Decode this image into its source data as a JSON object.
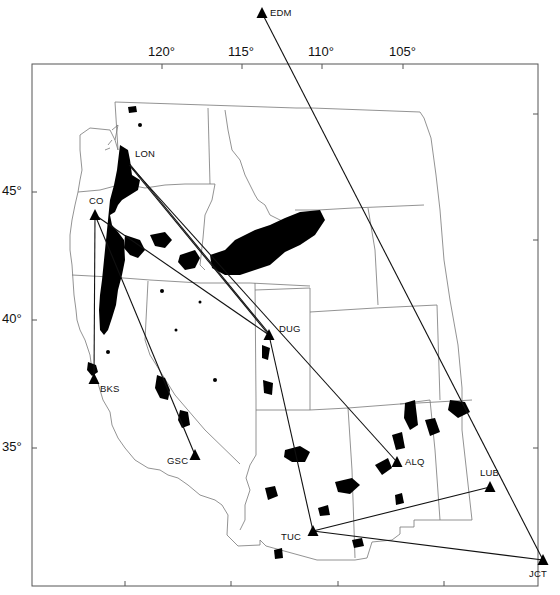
{
  "map": {
    "frame": {
      "left": 32,
      "top": 64,
      "right": 538,
      "bottom": 586
    },
    "colors": {
      "frame": "#555555",
      "border": "#777777",
      "path": "#111111",
      "lava": "#000000",
      "background": "#ffffff"
    },
    "axes": {
      "top_ticks": [
        {
          "label": "120°",
          "x": 162
        },
        {
          "label": "115°",
          "x": 242
        },
        {
          "label": "110°",
          "x": 322
        },
        {
          "label": "105°",
          "x": 403
        }
      ],
      "left_ticks": [
        {
          "label": "45°",
          "y": 192
        },
        {
          "label": "40°",
          "y": 320
        },
        {
          "label": "35°",
          "y": 448
        }
      ],
      "bottom_ticks_x": [
        125,
        231,
        338,
        444
      ],
      "right_ticks_y": [
        114,
        240,
        448
      ]
    },
    "stations": [
      {
        "code": "EDM",
        "x": 262,
        "y": 13,
        "label_dx": 8,
        "label_dy": -6
      },
      {
        "code": "LON",
        "x": 125,
        "y": 160,
        "label_dx": 10,
        "label_dy": -12
      },
      {
        "code": "CO",
        "x": 95,
        "y": 215,
        "label_dx": -6,
        "label_dy": -20
      },
      {
        "code": "BKS",
        "x": 94,
        "y": 379,
        "label_dx": 6,
        "label_dy": 4
      },
      {
        "code": "DUG",
        "x": 269,
        "y": 335,
        "label_dx": 10,
        "label_dy": -12
      },
      {
        "code": "GSC",
        "x": 195,
        "y": 455,
        "label_dx": -28,
        "label_dy": 0
      },
      {
        "code": "ALQ",
        "x": 397,
        "y": 462,
        "label_dx": 8,
        "label_dy": -6
      },
      {
        "code": "LUB",
        "x": 490,
        "y": 487,
        "label_dx": -10,
        "label_dy": -20
      },
      {
        "code": "TUC",
        "x": 313,
        "y": 531,
        "label_dx": -32,
        "label_dy": 0
      },
      {
        "code": "JCT",
        "x": 543,
        "y": 560,
        "label_dx": -14,
        "label_dy": 8
      }
    ],
    "paths": [
      [
        "EDM",
        "JCT"
      ],
      [
        "LON",
        "DUG"
      ],
      [
        "LON",
        "ALQ"
      ],
      [
        "CO",
        "BKS"
      ],
      [
        "CO",
        "GSC"
      ],
      [
        "CO",
        "DUG"
      ],
      [
        "DUG",
        "TUC"
      ],
      [
        "TUC",
        "LUB"
      ],
      [
        "TUC",
        "JCT"
      ]
    ]
  }
}
